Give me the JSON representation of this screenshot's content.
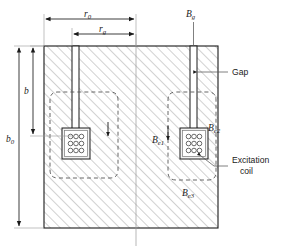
{
  "figure": {
    "type": "cross-section-diagram",
    "background_color": "#ffffff",
    "line_color": "#1a1a1a",
    "hatch_color": "#b8b8b8",
    "dashed_color": "#555555"
  },
  "dimensions": {
    "r0": {
      "label": "r",
      "subscript": "0",
      "orientation": "horizontal",
      "position": "top",
      "span": "outer width of left limb region"
    },
    "rg": {
      "label": "r",
      "subscript": "g",
      "orientation": "horizontal",
      "position": "top",
      "span": "inner width to gap"
    },
    "b": {
      "label": "b",
      "subscript": "",
      "orientation": "vertical",
      "position": "left",
      "span": "slot depth"
    },
    "b0": {
      "label": "b",
      "subscript": "0",
      "orientation": "vertical",
      "position": "left",
      "span": "total core height"
    }
  },
  "flux_labels": {
    "bg": {
      "label": "B",
      "subscript": "g",
      "note": "gap flux density"
    },
    "be1": {
      "label": "B",
      "subscript": "e1",
      "note": "flux path 1"
    },
    "be2": {
      "label": "B",
      "subscript": "e2",
      "note": "flux path 2"
    },
    "be3": {
      "label": "B",
      "subscript": "e3",
      "note": "flux path 3"
    }
  },
  "callouts": {
    "gap": {
      "text": "Gap"
    },
    "excitation_coil": {
      "line1": "Excitation",
      "line2": "coil"
    }
  },
  "coils": {
    "count": 2,
    "conductor_rows": 3,
    "conductor_cols": 3,
    "left_coil_name": "left-excitation-coil",
    "right_coil_name": "right-excitation-coil"
  }
}
